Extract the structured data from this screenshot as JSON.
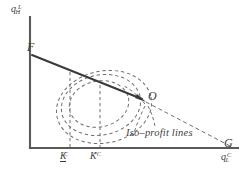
{
  "figure": {
    "type": "economics-diagram",
    "background_color": "#ffffff",
    "axes": {
      "y_label_base": "q",
      "y_label_sub": "H",
      "y_label_sup": "L",
      "x_label_base": "q",
      "x_label_sub": "L",
      "x_label_sup": "C",
      "axis_color": "#5a5a5a",
      "origin_px": [
        30,
        148
      ],
      "x_end_px": [
        238,
        148
      ],
      "y_end_px": [
        30,
        17
      ]
    },
    "points": {
      "F": {
        "label": "F",
        "px": [
          32,
          55
        ]
      },
      "O": {
        "label": "O",
        "px": [
          146,
          102
        ]
      },
      "G": {
        "label": "G",
        "px": [
          232,
          146
        ]
      }
    },
    "lines": {
      "budget_solid": {
        "name": "budget-frontier-solid",
        "from_px": [
          32,
          55
        ],
        "to_px": [
          146,
          102
        ],
        "style": "solid",
        "color": "#3a3a3a",
        "arrow_at_end": true
      },
      "budget_dashed": {
        "name": "budget-frontier-dashed-extension",
        "from_px": [
          146,
          102
        ],
        "to_px": [
          232,
          147
        ],
        "style": "dashed",
        "color": "#6d6d6d"
      }
    },
    "ticks": [
      {
        "name": "K-underbar-C",
        "base": "K",
        "sup": "C",
        "underbar": true,
        "x_px": 70,
        "label_left_px": 60
      },
      {
        "name": "K-star-C",
        "base": "K",
        "sup": "*C",
        "underbar": false,
        "x_px": 100,
        "label_left_px": 90
      }
    ],
    "iso_profit": {
      "annotation": "Iso–profit lines",
      "curve_color": "#6f6f6f",
      "curve_style": "dashed",
      "count": 3,
      "center_px": [
        102,
        106
      ],
      "ellipses": [
        {
          "rx": 48,
          "ry": 36,
          "rotate_deg": -12,
          "cx": 104,
          "cy": 107
        },
        {
          "rx": 40,
          "ry": 30,
          "rotate_deg": -12,
          "cx": 101,
          "cy": 105
        },
        {
          "rx": 30,
          "ry": 23,
          "rotate_deg": -12,
          "cx": 99,
          "cy": 104
        }
      ]
    },
    "guides": [
      {
        "name": "vertical-guide-K-underbar",
        "x_px": 70,
        "from_y_px": 72,
        "to_y_px": 148
      },
      {
        "name": "vertical-guide-K-star",
        "x_px": 100,
        "from_y_px": 85,
        "to_y_px": 148
      }
    ]
  }
}
